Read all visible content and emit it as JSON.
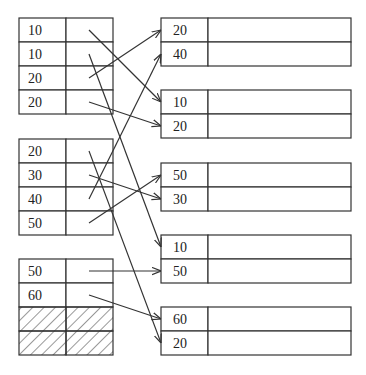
{
  "diagram": {
    "colors": {
      "stroke": "#333333",
      "background": "#ffffff",
      "text": "#222222"
    },
    "left_blocks": [
      {
        "id": "L1",
        "rows": [
          "10",
          "10",
          "20",
          "20"
        ],
        "hatched_rows": []
      },
      {
        "id": "L2",
        "rows": [
          "20",
          "30",
          "40",
          "50"
        ],
        "hatched_rows": []
      },
      {
        "id": "L3",
        "rows": [
          "50",
          "60",
          "",
          ""
        ],
        "hatched_rows": [
          2,
          3
        ]
      }
    ],
    "right_blocks": [
      {
        "id": "R1",
        "rows": [
          "20",
          "40"
        ]
      },
      {
        "id": "R2",
        "rows": [
          "10",
          "20"
        ]
      },
      {
        "id": "R3",
        "rows": [
          "50",
          "30"
        ]
      },
      {
        "id": "R4",
        "rows": [
          "10",
          "50"
        ]
      },
      {
        "id": "R5",
        "rows": [
          "60",
          "20"
        ]
      }
    ],
    "arrows": [
      {
        "from": [
          "L1",
          0
        ],
        "to": [
          "R2",
          0
        ]
      },
      {
        "from": [
          "L1",
          1
        ],
        "to": [
          "R4",
          0
        ]
      },
      {
        "from": [
          "L1",
          2
        ],
        "to": [
          "R1",
          0
        ]
      },
      {
        "from": [
          "L1",
          3
        ],
        "to": [
          "R2",
          1
        ]
      },
      {
        "from": [
          "L2",
          0
        ],
        "to": [
          "R5",
          1
        ]
      },
      {
        "from": [
          "L2",
          1
        ],
        "to": [
          "R3",
          1
        ]
      },
      {
        "from": [
          "L2",
          2
        ],
        "to": [
          "R1",
          1
        ]
      },
      {
        "from": [
          "L2",
          3
        ],
        "to": [
          "R3",
          0
        ]
      },
      {
        "from": [
          "L3",
          0
        ],
        "to": [
          "R4",
          1
        ]
      },
      {
        "from": [
          "L3",
          1
        ],
        "to": [
          "R5",
          0
        ]
      }
    ]
  }
}
